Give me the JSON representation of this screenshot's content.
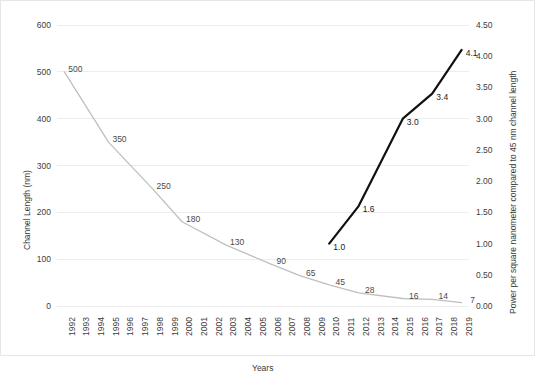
{
  "figure": {
    "background": "#ffffff",
    "border_color": "#e6e6e6"
  },
  "axes": {
    "left": {
      "title": "Channel Length (nm)",
      "ticks": [
        "600",
        "500",
        "400",
        "300",
        "200",
        "100",
        "0"
      ],
      "min": 0,
      "max": 600,
      "step": 100
    },
    "right": {
      "title": "Power  per square nanometer compared to 45 nm channel length",
      "ticks": [
        "4.50",
        "4.00",
        "3.50",
        "3.00",
        "2.50",
        "2.00",
        "1.50",
        "1.00",
        "0.50",
        "0.00"
      ],
      "min": 0.0,
      "max": 4.5,
      "step": 0.5
    },
    "x": {
      "title": "Years",
      "ticks": [
        "1992",
        "1993",
        "1994",
        "1995",
        "1996",
        "1997",
        "1998",
        "1999",
        "2000",
        "2001",
        "2002",
        "2003",
        "2004",
        "2005",
        "2006",
        "2007",
        "2008",
        "2009",
        "2010",
        "2011",
        "2012",
        "2013",
        "2014",
        "2015",
        "2016",
        "2017",
        "2018",
        "2019"
      ]
    }
  },
  "colors": {
    "gray_series": "#bfbfbf",
    "black_series": "#111111",
    "gridline": "#ededed",
    "text": "#3a3a3a"
  },
  "chart_data": {
    "type": "line",
    "title": "",
    "xlabel": "Years",
    "ylabel": "Channel Length (nm)",
    "y2label": "Power  per square nanometer compared to 45 nm channel length",
    "x": [
      "1992",
      "1993",
      "1994",
      "1995",
      "1996",
      "1997",
      "1998",
      "1999",
      "2000",
      "2001",
      "2002",
      "2003",
      "2004",
      "2005",
      "2006",
      "2007",
      "2008",
      "2009",
      "2010",
      "2011",
      "2012",
      "2013",
      "2014",
      "2015",
      "2016",
      "2017",
      "2018",
      "2019"
    ],
    "xlim": [
      1992,
      2019
    ],
    "ylim": [
      0,
      600
    ],
    "y2lim": [
      0.0,
      4.5
    ],
    "grid": true,
    "legend": "none",
    "series": [
      {
        "name": "Channel Length (nm)",
        "axis": "left",
        "color": "#bfbfbf",
        "labels_shown": true,
        "points": [
          {
            "year": 1992,
            "value": 500,
            "label": "500"
          },
          {
            "year": 1995,
            "value": 350,
            "label": "350"
          },
          {
            "year": 1998,
            "value": 250,
            "label": "250"
          },
          {
            "year": 2000,
            "value": 180,
            "label": "180"
          },
          {
            "year": 2003,
            "value": 130,
            "label": "130"
          },
          {
            "year": 2006,
            "value": 90,
            "label": "90"
          },
          {
            "year": 2008,
            "value": 65,
            "label": "65"
          },
          {
            "year": 2010,
            "value": 45,
            "label": "45"
          },
          {
            "year": 2012,
            "value": 28,
            "label": "28"
          },
          {
            "year": 2015,
            "value": 16,
            "label": "16"
          },
          {
            "year": 2017,
            "value": 14,
            "label": "14"
          },
          {
            "year": 2019,
            "value": 7,
            "label": "7"
          }
        ]
      },
      {
        "name": "Power per square nanometer compared to 45 nm channel length",
        "axis": "right",
        "color": "#111111",
        "labels_shown": true,
        "points": [
          {
            "year": 2010,
            "value": 1.0,
            "label": "1.0"
          },
          {
            "year": 2012,
            "value": 1.6,
            "label": "1.6"
          },
          {
            "year": 2015,
            "value": 3.0,
            "label": "3.0"
          },
          {
            "year": 2017,
            "value": 3.4,
            "label": "3.4"
          },
          {
            "year": 2019,
            "value": 4.1,
            "label": "4.1"
          }
        ]
      }
    ]
  }
}
